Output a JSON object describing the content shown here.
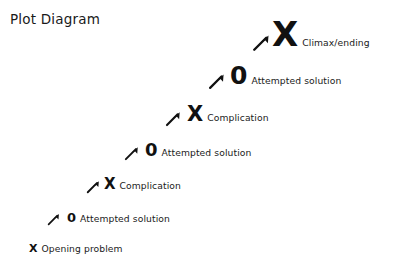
{
  "title": "Plot Diagram",
  "colors": {
    "background": "#ffffff",
    "ink": "#1a1a1a",
    "symbol": "#111111"
  },
  "chart_data": {
    "type": "diagram",
    "title": "Plot Diagram",
    "stages": [
      {
        "index": 1,
        "symbol": "X",
        "label": "Opening problem",
        "symbol_size": 11,
        "x": 29,
        "y": 254
      },
      {
        "index": 2,
        "symbol": "0",
        "label": "Attempted solution",
        "symbol_size": 13,
        "x": 67,
        "y": 224
      },
      {
        "index": 3,
        "symbol": "X",
        "label": "Complication",
        "symbol_size": 15,
        "x": 104,
        "y": 192
      },
      {
        "index": 4,
        "symbol": "0",
        "label": "Attempted solution",
        "symbol_size": 18,
        "x": 145,
        "y": 159
      },
      {
        "index": 5,
        "symbol": "X",
        "label": "Complication",
        "symbol_size": 21,
        "x": 187,
        "y": 125
      },
      {
        "index": 6,
        "symbol": "0",
        "label": "Attempted solution",
        "symbol_size": 25,
        "x": 230,
        "y": 88
      },
      {
        "index": 7,
        "symbol": "X",
        "label": "Climax/ending",
        "symbol_size": 34,
        "x": 272,
        "y": 51
      }
    ],
    "arrows": [
      {
        "from": 1,
        "to": 2,
        "x": 47,
        "y": 226,
        "size": 13,
        "direction": "northeast"
      },
      {
        "from": 2,
        "to": 3,
        "x": 86,
        "y": 194,
        "size": 14,
        "direction": "northeast"
      },
      {
        "from": 3,
        "to": 4,
        "x": 124,
        "y": 161,
        "size": 15,
        "direction": "northeast"
      },
      {
        "from": 4,
        "to": 5,
        "x": 165,
        "y": 127,
        "size": 16,
        "direction": "northeast"
      },
      {
        "from": 5,
        "to": 6,
        "x": 208,
        "y": 90,
        "size": 17,
        "direction": "northeast"
      },
      {
        "from": 6,
        "to": 7,
        "x": 252,
        "y": 52,
        "size": 18,
        "direction": "northeast"
      }
    ]
  }
}
